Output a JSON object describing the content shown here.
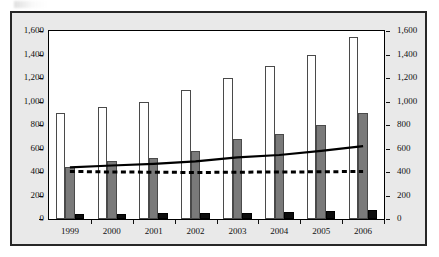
{
  "chart_data": {
    "type": "bar",
    "title": "",
    "subtitle": "",
    "xlabel": "",
    "ylabel": "",
    "categories": [
      "1999",
      "2000",
      "2001",
      "2002",
      "2003",
      "2004",
      "2005",
      "2006"
    ],
    "ylim": [
      0,
      1600
    ],
    "y2lim": [
      0,
      1600
    ],
    "ytick_labels": [
      "1,600",
      "1,400",
      "1,200",
      "1,000",
      "800",
      "600",
      "400",
      "200",
      "0"
    ],
    "ytick_values": [
      1600,
      1400,
      1200,
      1000,
      800,
      600,
      400,
      200,
      0
    ],
    "y2tick_labels": [
      "1,600",
      "1,400",
      "1,200",
      "1,000",
      "800",
      "600",
      "400",
      "200",
      "0"
    ],
    "y2tick_values": [
      1600,
      1400,
      1200,
      1000,
      800,
      600,
      400,
      200,
      0
    ],
    "grid": false,
    "legend": "none",
    "series": [
      {
        "name": "white-bars",
        "kind": "bar",
        "style": "open-white",
        "color": "#ffffff",
        "edge": "#4a4a4a",
        "values": [
          900,
          950,
          1000,
          1100,
          1200,
          1300,
          1400,
          1550
        ]
      },
      {
        "name": "gray-bars",
        "kind": "bar",
        "style": "filled-gray",
        "color": "#7a7a7a",
        "edge": "#4a4a4a",
        "values": [
          445,
          490,
          520,
          580,
          680,
          720,
          800,
          900
        ]
      },
      {
        "name": "black-bars",
        "kind": "bar",
        "style": "filled-black",
        "color": "#0d0d0d",
        "edge": "#000000",
        "values": [
          40,
          45,
          50,
          50,
          55,
          60,
          70,
          75
        ]
      },
      {
        "name": "solid-line",
        "kind": "line",
        "style": "solid",
        "color": "#000000",
        "values": [
          440,
          455,
          470,
          490,
          525,
          545,
          580,
          620
        ]
      },
      {
        "name": "dashed-line",
        "kind": "line",
        "style": "dashed",
        "color": "#000000",
        "values": [
          405,
          400,
          398,
          396,
          398,
          400,
          402,
          405
        ]
      }
    ]
  }
}
